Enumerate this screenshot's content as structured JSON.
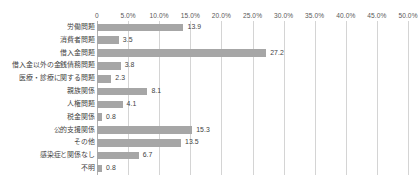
{
  "chart_data": {
    "type": "bar",
    "orientation": "horizontal",
    "title": "",
    "xlabel": "",
    "ylabel": "",
    "xlim": [
      0,
      50
    ],
    "grid": true,
    "legend": "none",
    "bar_color": "#a6a6a6",
    "gridline_color": "#d4d4d4",
    "axis_color": "#b0b0b0",
    "xticks": [
      "0",
      "5.0%",
      "10.0%",
      "15.0%",
      "20.0%",
      "25.0%",
      "30.0%",
      "35.0%",
      "40.0%",
      "45.0%",
      "50.0%"
    ],
    "xtick_values": [
      0,
      5,
      10,
      15,
      20,
      25,
      30,
      35,
      40,
      45,
      50
    ],
    "categories": [
      "労働問題",
      "消費者問題",
      "借入金問題",
      "借入金以外の金銭債務問題",
      "医療・診療に関する問題",
      "親族関係",
      "人権問題",
      "税金関係",
      "公的支援関係",
      "その他",
      "感染症と関係なし",
      "不明"
    ],
    "values": [
      13.9,
      3.5,
      27.2,
      3.8,
      2.3,
      8.1,
      4.1,
      0.8,
      15.3,
      13.5,
      6.7,
      0.8
    ],
    "value_labels": [
      "13.9",
      "3.5",
      "27.2",
      "3.8",
      "2.3",
      "8.1",
      "4.1",
      "0.8",
      "15.3",
      "13.5",
      "6.7",
      "0.8"
    ]
  }
}
